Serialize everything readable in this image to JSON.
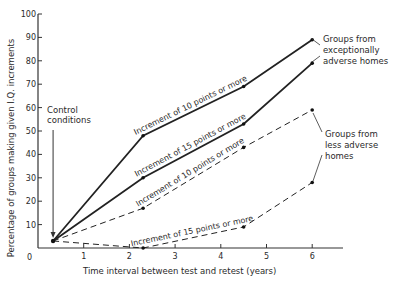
{
  "chart_data": {
    "type": "line",
    "title": "",
    "xlabel": "Time interval between test and retest   (years)",
    "ylabel": "Percentage of groups making given I.Q. increments",
    "xlim": [
      0,
      6.5
    ],
    "ylim": [
      0,
      100
    ],
    "x_ticks": [
      0,
      1,
      2,
      3,
      4,
      5,
      6
    ],
    "y_ticks": [
      10,
      20,
      30,
      40,
      50,
      60,
      70,
      80,
      90,
      100
    ],
    "grid": false,
    "legend": "none (inline annotations)",
    "control_point": {
      "x": 0.33,
      "y": 3
    },
    "series": [
      {
        "name": "Increment of 10 points or more",
        "group": "Groups from exceptionally adverse homes",
        "style": "solid",
        "points": [
          [
            0.33,
            3
          ],
          [
            2.3,
            48
          ],
          [
            4.5,
            69
          ],
          [
            6,
            89
          ]
        ]
      },
      {
        "name": "Increment of 15 points or more",
        "group": "Groups from exceptionally adverse homes",
        "style": "solid",
        "points": [
          [
            0.33,
            3
          ],
          [
            2.3,
            30
          ],
          [
            4.5,
            53
          ],
          [
            6,
            79
          ]
        ]
      },
      {
        "name": "Increment of 10 points or more",
        "group": "Groups from less adverse homes",
        "style": "dashed",
        "points": [
          [
            0.33,
            3
          ],
          [
            2.3,
            17
          ],
          [
            4.5,
            43
          ],
          [
            6,
            59
          ]
        ]
      },
      {
        "name": "Increment of 15 points or more",
        "group": "Groups from less adverse homes",
        "style": "dashed",
        "points": [
          [
            0.33,
            3
          ],
          [
            2.3,
            0
          ],
          [
            4.5,
            9
          ],
          [
            6,
            28
          ]
        ]
      }
    ],
    "annotations": [
      "Control conditions",
      "Groups from exceptionally adverse homes",
      "Groups from less adverse homes"
    ]
  },
  "labels": {
    "control": [
      "Control",
      "conditions"
    ],
    "exceptional": [
      "Groups from",
      "exceptionally",
      "adverse homes"
    ],
    "less": [
      "Groups from",
      "less adverse",
      "homes"
    ],
    "origin": "0"
  }
}
